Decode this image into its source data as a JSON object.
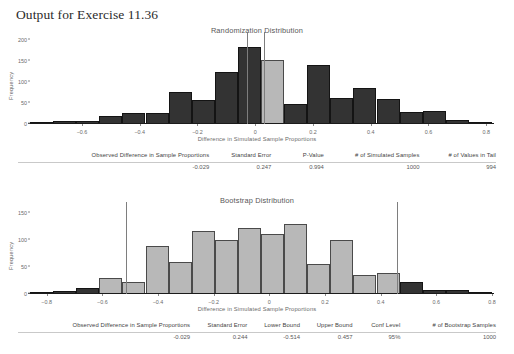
{
  "page_title": "Output for Exercise 11.36",
  "randomization": {
    "title": "Randomization Distribution",
    "ylabel": "Frequency",
    "xlabel": "Difference in Simulated Sample Proportions",
    "yticks": [
      "0",
      "50",
      "100",
      "150",
      "200"
    ],
    "xticks": [
      "-0.6",
      "-0.4",
      "-0.2",
      "0",
      "0.2",
      "0.4",
      "0.6",
      "0.8"
    ],
    "table": {
      "headers": [
        "Observed Difference in Sample Proportions",
        "Standard Error",
        "P-Value",
        "# of Simulated Samples",
        "# of Values in Tail"
      ],
      "values": [
        "-0.029",
        "0.247",
        "0.994",
        "1000",
        "994"
      ]
    }
  },
  "bootstrap": {
    "title": "Bootstrap Distribution",
    "ylabel": "Frequency",
    "xlabel": "Difference in Simulated Sample Proportions",
    "yticks": [
      "0",
      "50",
      "100",
      "150"
    ],
    "xticks": [
      "-0.8",
      "-0.6",
      "-0.4",
      "-0.2",
      "0",
      "0.2",
      "0.4",
      "0.6",
      "0.8"
    ],
    "table": {
      "headers": [
        "Observed Difference in Sample Proportions",
        "Standard Error",
        "Lower Bound",
        "Upper Bound",
        "Conf Level",
        "# of Bootstrap Samples"
      ],
      "values": [
        "-0.029",
        "0.244",
        "-0.514",
        "0.457",
        "95%",
        "1000"
      ]
    }
  },
  "colors": {
    "bar_dark": "#333333",
    "bar_light": "#b8b8b8",
    "axis": "#1b1b1b",
    "marker_line": "#7e7e7e"
  },
  "chart_data": [
    {
      "type": "bar",
      "title": "Randomization Distribution",
      "xlabel": "Difference in Simulated Sample Proportions",
      "ylabel": "Frequency",
      "xlim": [
        -0.78,
        0.82
      ],
      "ylim": [
        0,
        205
      ],
      "yticks": [
        0,
        50,
        100,
        150,
        200
      ],
      "xticks": [
        -0.6,
        -0.4,
        -0.2,
        0,
        0.2,
        0.4,
        0.6,
        0.8
      ],
      "bin_width": 0.08,
      "bin_left_edges": [
        -0.78,
        -0.7,
        -0.62,
        -0.54,
        -0.46,
        -0.38,
        -0.3,
        -0.22,
        -0.14,
        -0.06,
        0.02,
        0.1,
        0.18,
        0.26,
        0.34,
        0.42,
        0.5,
        0.58,
        0.66,
        0.74
      ],
      "values": [
        1,
        7,
        7,
        18,
        27,
        27,
        77,
        57,
        125,
        183,
        152,
        47,
        140,
        63,
        85,
        60,
        28,
        30,
        9,
        5
      ],
      "bar_colors": [
        "dark",
        "dark",
        "dark",
        "dark",
        "dark",
        "dark",
        "dark",
        "dark",
        "dark",
        "dark",
        "light",
        "dark",
        "dark",
        "dark",
        "dark",
        "dark",
        "dark",
        "dark",
        "dark",
        "dark"
      ],
      "vlines": [
        -0.029,
        0.029
      ],
      "grid": false,
      "legend": false
    },
    {
      "type": "bar",
      "title": "Bootstrap Distribution",
      "xlabel": "Difference in Simulated Sample Proportions",
      "ylabel": "Frequency",
      "xlim": [
        -0.86,
        0.8
      ],
      "ylim": [
        0,
        160
      ],
      "yticks": [
        0,
        50,
        100,
        150
      ],
      "xticks": [
        -0.8,
        -0.6,
        -0.4,
        -0.2,
        0,
        0.2,
        0.4,
        0.6,
        0.8
      ],
      "bin_width": 0.083,
      "bin_left_edges": [
        -0.86,
        -0.777,
        -0.694,
        -0.611,
        -0.528,
        -0.445,
        -0.362,
        -0.279,
        -0.196,
        -0.113,
        -0.03,
        0.053,
        0.136,
        0.219,
        0.302,
        0.385,
        0.468,
        0.551,
        0.634,
        0.717
      ],
      "values": [
        1,
        5,
        12,
        30,
        22,
        90,
        60,
        118,
        101,
        123,
        112,
        130,
        55,
        100,
        35,
        40,
        22,
        8,
        8,
        3
      ],
      "bar_colors": [
        "dark",
        "dark",
        "dark",
        "light",
        "light",
        "light",
        "light",
        "light",
        "light",
        "light",
        "light",
        "light",
        "light",
        "light",
        "light",
        "light",
        "dark",
        "dark",
        "dark",
        "dark"
      ],
      "vlines": [
        -0.514,
        0.457
      ],
      "grid": false,
      "legend": false
    }
  ]
}
